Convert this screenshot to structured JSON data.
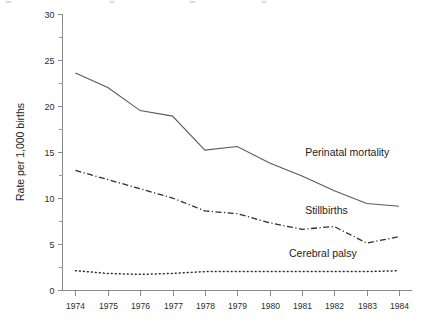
{
  "chart_data": {
    "type": "line",
    "title": "",
    "xlabel": "",
    "ylabel": "Rate per 1,000 births",
    "x": [
      1974,
      1975,
      1976,
      1977,
      1978,
      1979,
      1980,
      1981,
      1982,
      1983,
      1984
    ],
    "categories": [
      "1974",
      "1975",
      "1976",
      "1977",
      "1978",
      "1979",
      "1980",
      "1981",
      "1982",
      "1983",
      "1984"
    ],
    "xlim": [
      1973.6,
      1984.4
    ],
    "ylim": [
      0,
      30
    ],
    "y_ticks": [
      0,
      5,
      10,
      15,
      20,
      25,
      30
    ],
    "y_tick_labels": [
      "0",
      "5",
      "10",
      "15",
      "20",
      "25",
      "30"
    ],
    "y_minor_ticks": [
      2.5,
      7.5,
      12.5,
      17.5,
      22.5,
      27.5
    ],
    "grid": false,
    "legend_position": "inline-right",
    "series": [
      {
        "name": "Perinatal mortality",
        "style": "solid",
        "color": "#5a5a5a",
        "values": [
          23.6,
          22.0,
          19.5,
          18.9,
          15.2,
          15.6,
          13.8,
          12.4,
          10.8,
          9.4,
          9.1
        ]
      },
      {
        "name": "Stillbirths",
        "style": "dash-dot",
        "color": "#2e2e2e",
        "values": [
          13.0,
          12.0,
          11.0,
          10.0,
          8.6,
          8.3,
          7.3,
          6.6,
          6.9,
          5.1,
          5.8
        ]
      },
      {
        "name": "Cerebral palsy",
        "style": "dotted",
        "color": "#2e2e2e",
        "values": [
          2.1,
          1.8,
          1.7,
          1.8,
          2.0,
          2.0,
          2.0,
          2.0,
          2.0,
          2.0,
          2.1
        ]
      }
    ],
    "annotations": [
      {
        "text": "Perinatal mortality",
        "x": 1981.1,
        "y": 14.6
      },
      {
        "text": "Stillbirths",
        "x": 1981.1,
        "y": 8.3
      },
      {
        "text": "Cerebral palsy",
        "x": 1980.6,
        "y": 3.6
      }
    ]
  }
}
